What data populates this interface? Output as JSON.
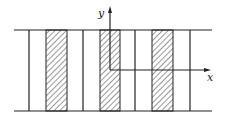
{
  "diagram": {
    "axes": {
      "x_label": "x",
      "y_label": "y"
    },
    "colors": {
      "line": "#222222",
      "background": "#ffffff"
    }
  }
}
